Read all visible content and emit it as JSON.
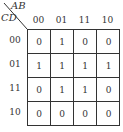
{
  "kmap": {
    "col_var": "AB",
    "row_var": "CD",
    "col_headers": [
      "00",
      "01",
      "11",
      "10"
    ],
    "row_headers": [
      "00",
      "01",
      "11",
      "10"
    ],
    "cells": [
      [
        "0",
        "1",
        "0",
        "0"
      ],
      [
        "1",
        "1",
        "1",
        "1"
      ],
      [
        "0",
        "1",
        "1",
        "0"
      ],
      [
        "0",
        "0",
        "0",
        "0"
      ]
    ]
  }
}
